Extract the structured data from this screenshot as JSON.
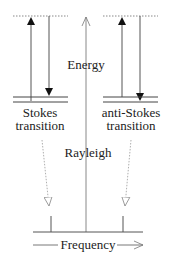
{
  "diagram": {
    "labels": {
      "energy": "Energy",
      "stokes_line1": "Stokes",
      "stokes_line2": "transition",
      "anti_stokes_line1": "anti-Stokes",
      "anti_stokes_line2": "transition",
      "rayleigh": "Rayleigh",
      "frequency": "Frequency"
    },
    "colors": {
      "line": "#444444",
      "dotted": "#888888",
      "text": "#222222"
    }
  }
}
